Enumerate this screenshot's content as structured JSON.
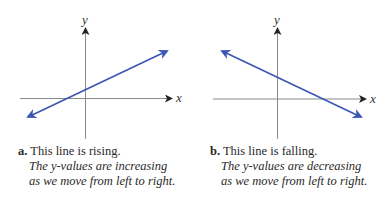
{
  "figures": [
    {
      "letter": "a.",
      "title": "This line is rising.",
      "description_lines": [
        "The y-values are increasing",
        "as we move from left to right."
      ],
      "x_axis_label": "x",
      "y_axis_label": "y",
      "trend": "rising"
    },
    {
      "letter": "b.",
      "title": "This line is falling.",
      "description_lines": [
        "The y-values are decreasing",
        "as we move from left to right."
      ],
      "x_axis_label": "x",
      "y_axis_label": "y",
      "trend": "falling"
    }
  ],
  "colors": {
    "line": "#3a56b4",
    "axis": "#8a8a8a",
    "arrowhead_axis": "#222222"
  }
}
